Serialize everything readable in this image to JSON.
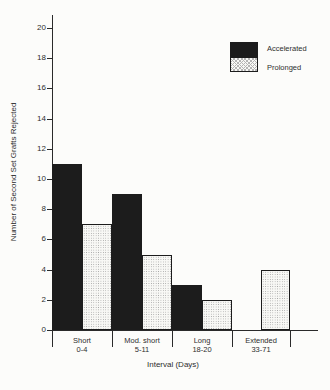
{
  "figure": {
    "background_color": "#fcfcfa",
    "axis_color": "#2a2a2a",
    "text_color": "#2e2e2e"
  },
  "chart_data": {
    "type": "bar",
    "title": "",
    "xlabel": "Interval (Days)",
    "ylabel": "Number of Second Set Grafts Rejected",
    "ylim": [
      0,
      20
    ],
    "yticks": [
      0,
      2,
      4,
      6,
      8,
      10,
      12,
      14,
      16,
      18,
      20
    ],
    "grid": false,
    "legend_position": "top-right",
    "categories": [
      {
        "name": "Short",
        "range": "0-4"
      },
      {
        "name": "Mod. short",
        "range": "5-11"
      },
      {
        "name": "Long",
        "range": "18-20"
      },
      {
        "name": "Extended",
        "range": "33-71"
      }
    ],
    "series": [
      {
        "name": "Accelerated",
        "style": "solid",
        "color": "#1c1c1c",
        "values": [
          11,
          9,
          3,
          null
        ]
      },
      {
        "name": "Prolonged",
        "style": "stipple",
        "color": "#9f9f9f",
        "values": [
          7,
          5,
          2,
          4
        ]
      }
    ]
  }
}
